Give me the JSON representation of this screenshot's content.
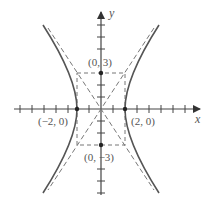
{
  "diagram": {
    "type": "hyperbola",
    "equation_shape": "x^2/4 - y^2/9 = 1",
    "axes": {
      "x_label": "x",
      "y_label": "y"
    },
    "points": [
      {
        "label": "(0, 3)",
        "x": 0,
        "y": 3
      },
      {
        "label": "(−2, 0)",
        "x": -2,
        "y": 0
      },
      {
        "label": "(2, 0)",
        "x": 2,
        "y": 0
      },
      {
        "label": "(0, −3)",
        "x": 0,
        "y": -3
      }
    ],
    "vertices": [
      [
        -2,
        0
      ],
      [
        2,
        0
      ]
    ],
    "asymptote_slopes": [
      1.5,
      -1.5
    ],
    "fundamental_rectangle": {
      "x": [
        -2,
        2
      ],
      "y": [
        -3,
        3
      ]
    },
    "x_range": [
      -7,
      8
    ],
    "y_range": [
      -7,
      8
    ],
    "colors": {
      "curve": "#555555",
      "axis": "#444444",
      "dashed": "#777777",
      "point": "#222222"
    }
  }
}
